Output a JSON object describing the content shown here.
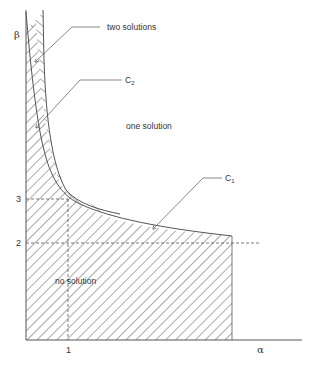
{
  "diagram": {
    "axes": {
      "y_label": "β",
      "x_label": "α",
      "y_ticks": [
        {
          "value": "3",
          "y": 199
        },
        {
          "value": "2",
          "y": 243
        }
      ],
      "x_ticks": [
        {
          "value": "1",
          "x": 68
        }
      ]
    },
    "regions": {
      "two_solutions": "two solutions",
      "one_solution": "one solution",
      "no_solution": "no solution"
    },
    "curves": {
      "c1": {
        "main": "C",
        "sub": "1"
      },
      "c2": {
        "main": "C",
        "sub": "2"
      }
    },
    "colors": {
      "line": "#555555",
      "hatch": "#444444",
      "background": "#ffffff"
    }
  }
}
